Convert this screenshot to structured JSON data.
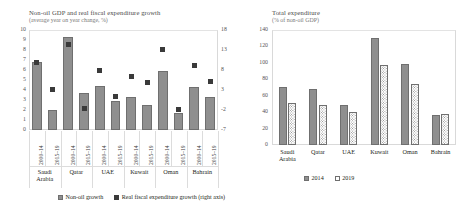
{
  "left_panel": {
    "title": "Non-oil GDP and real fiscal expenditure growth",
    "subtitle": "(average year on year change, %)",
    "legend": [
      {
        "label": "Non-oil growth",
        "style": "solid"
      },
      {
        "label": "Real fiscal expenditure growth (right axis)",
        "style": "mark"
      }
    ]
  },
  "right_panel": {
    "title": "Total expenditure",
    "subtitle": "(% of non-oil GDP)",
    "legend": [
      {
        "label": "2014",
        "style": "solid"
      },
      {
        "label": "2019",
        "style": "dotted"
      }
    ]
  },
  "chart_data": [
    {
      "id": "non-oil-gdp-and-real-fiscal-expenditure-growth",
      "type": "bar",
      "title": "Non-oil GDP and real fiscal expenditure growth",
      "subtitle": "(average year on year change, %)",
      "xlabel": "",
      "ylabel": "",
      "ylim": [
        0,
        10
      ],
      "yticks": [
        0,
        1,
        2,
        3,
        4,
        5,
        6,
        7,
        8,
        9,
        10
      ],
      "y2lim": [
        -7,
        18
      ],
      "y2ticks": [
        -7,
        -2,
        3,
        8,
        13,
        18
      ],
      "grid": false,
      "legend_position": "bottom",
      "countries": [
        "Saudi Arabia",
        "Qatar",
        "UAE",
        "Kuwait",
        "Oman",
        "Bahrain"
      ],
      "periods": [
        "2000–14",
        "2015–19"
      ],
      "categories": [
        "Saudi Arabia 2000–14",
        "Saudi Arabia 2015–19",
        "Qatar 2000–14",
        "Qatar 2015–19",
        "UAE 2000–14",
        "UAE 2015–19",
        "Kuwait 2000–14",
        "Kuwait 2015–19",
        "Oman 2000–14",
        "Oman 2015–19",
        "Bahrain 2000–14",
        "Bahrain 2015–19"
      ],
      "series": [
        {
          "name": "Non-oil growth",
          "axis": "left",
          "type": "bar",
          "values": [
            6.8,
            2.0,
            9.3,
            3.7,
            4.4,
            2.9,
            3.3,
            2.5,
            5.9,
            1.7,
            4.3,
            3.3
          ]
        },
        {
          "name": "Real fiscal expenditure growth (right axis)",
          "axis": "right",
          "type": "marker",
          "values": [
            10.0,
            3.2,
            14.5,
            -1.5,
            8.0,
            1.3,
            6.5,
            4.9,
            13.2,
            -1.8,
            9.2,
            5.2
          ]
        }
      ]
    },
    {
      "id": "total-expenditure",
      "type": "bar",
      "title": "Total expenditure",
      "subtitle": "(% of non-oil GDP)",
      "xlabel": "",
      "ylabel": "",
      "ylim": [
        0,
        140
      ],
      "yticks": [
        0,
        20,
        40,
        60,
        80,
        100,
        120,
        140
      ],
      "grid": false,
      "legend_position": "bottom",
      "categories": [
        "Saudi Arabia",
        "Qatar",
        "UAE",
        "Kuwait",
        "Oman",
        "Bahrain"
      ],
      "series": [
        {
          "name": "2014",
          "values": [
            71,
            68,
            49,
            130,
            99,
            37
          ]
        },
        {
          "name": "2019",
          "values": [
            51,
            49,
            40,
            97,
            74,
            38
          ]
        }
      ]
    }
  ]
}
